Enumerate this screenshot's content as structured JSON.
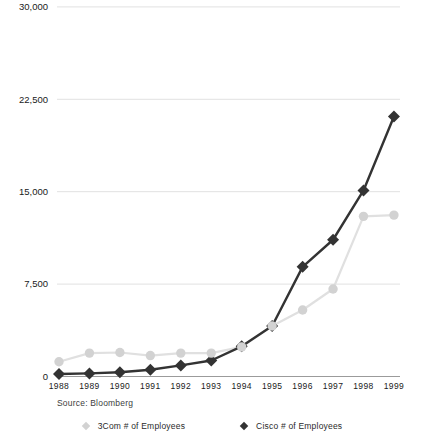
{
  "chart_data": {
    "type": "line",
    "title": "",
    "xlabel": "",
    "ylabel": "",
    "x": [
      "1988",
      "1989",
      "1990",
      "1991",
      "1992",
      "1993",
      "1994",
      "1995",
      "1996",
      "1997",
      "1998",
      "1999"
    ],
    "series": [
      {
        "name": "3Com # of Employees",
        "values": [
          1200,
          1900,
          1950,
          1700,
          1900,
          1900,
          2400,
          4100,
          5400,
          7100,
          13000,
          13100
        ],
        "line_color": "#e0e0e0",
        "marker_color": "#d2d2d2",
        "marker": "circle"
      },
      {
        "name": "Cisco # of Employees",
        "values": [
          200,
          250,
          350,
          550,
          900,
          1300,
          2450,
          4100,
          8900,
          11100,
          15100,
          21100
        ],
        "line_color": "#333333",
        "marker_color": "#333333",
        "marker": "diamond"
      }
    ],
    "ylim": [
      0,
      30000
    ],
    "yticks": [
      {
        "value": 0,
        "label": "0"
      },
      {
        "value": 7500,
        "label": "7,500"
      },
      {
        "value": 15000,
        "label": "15,000"
      },
      {
        "value": 22500,
        "label": "22,500"
      },
      {
        "value": 30000,
        "label": "30,000"
      }
    ],
    "grid": "horizontal",
    "legend_position": "bottom",
    "source": "Source: Bloomberg",
    "colors": {
      "gridline": "#e1e1e1",
      "axis_line": "#9b9b9b",
      "tick_text": "#1a1a1a"
    }
  }
}
